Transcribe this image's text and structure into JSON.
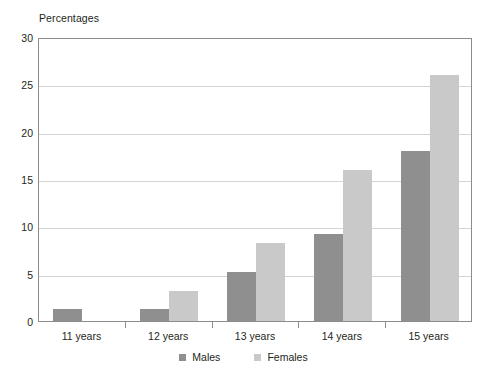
{
  "chart_data": {
    "type": "bar",
    "title": "Percentages",
    "xlabel": "",
    "ylabel": "Percentages",
    "categories": [
      "11 years",
      "12 years",
      "13 years",
      "14 years",
      "15 years"
    ],
    "series": [
      {
        "name": "Males",
        "color": "#8f8f8f",
        "values": [
          1.3,
          1.3,
          5.2,
          9.2,
          18.0
        ]
      },
      {
        "name": "Females",
        "color": "#c9c9c9",
        "values": [
          0.0,
          3.2,
          8.2,
          16.0,
          26.0
        ]
      }
    ],
    "ylim": [
      0,
      30
    ],
    "yticks": [
      0,
      5,
      10,
      15,
      20,
      25,
      30
    ],
    "ytick_labels": [
      "0",
      "5",
      "10",
      "15",
      "20",
      "25",
      "30"
    ],
    "grid": true,
    "grid_axis": "y",
    "legend_position": "bottom-center",
    "frame": true
  },
  "legend": {
    "items": [
      {
        "label": "Males"
      },
      {
        "label": "Females"
      }
    ]
  }
}
